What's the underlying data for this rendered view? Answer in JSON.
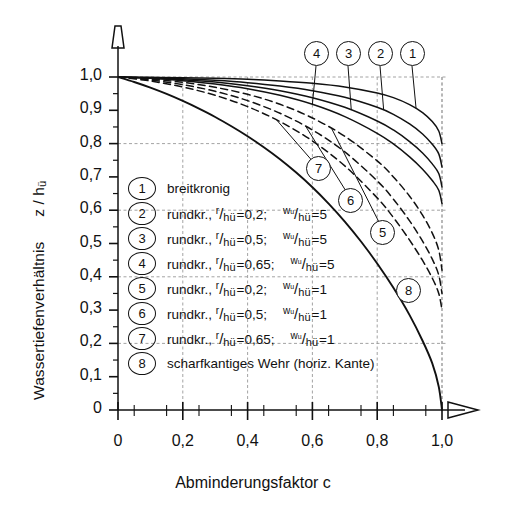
{
  "chart_data": {
    "type": "line",
    "title": "",
    "xlabel": "Abminderungsfaktor c",
    "ylabel": "Wassertiefenverhältnis z / hü",
    "xlim": [
      0,
      1.0
    ],
    "ylim": [
      0,
      1.0
    ],
    "xticks": [
      "0",
      "0,2",
      "0,4",
      "0,6",
      "0,8",
      "1,0"
    ],
    "xtick_values": [
      0,
      0.2,
      0.4,
      0.6,
      0.8,
      1.0
    ],
    "yticks": [
      "1,0",
      "0,9",
      "0,8",
      "0,7",
      "0,6",
      "0,5",
      "0,4",
      "0,3",
      "0,2",
      "0,1",
      "0"
    ],
    "ytick_values": [
      1.0,
      0.9,
      0.8,
      0.7,
      0.6,
      0.5,
      0.4,
      0.3,
      0.2,
      0.1,
      0
    ],
    "grid": true,
    "grid_style": "dashed",
    "legend_position": "inside-lower-left",
    "series": [
      {
        "id": 1,
        "name": "breitkronig",
        "style": "solid",
        "label_position": "top",
        "points": [
          [
            0,
            1.0
          ],
          [
            0.1,
            0.999
          ],
          [
            0.2,
            0.998
          ],
          [
            0.3,
            0.996
          ],
          [
            0.4,
            0.993
          ],
          [
            0.5,
            0.988
          ],
          [
            0.6,
            0.981
          ],
          [
            0.7,
            0.97
          ],
          [
            0.8,
            0.952
          ],
          [
            0.85,
            0.938
          ],
          [
            0.9,
            0.917
          ],
          [
            0.94,
            0.893
          ],
          [
            0.97,
            0.866
          ],
          [
            0.99,
            0.838
          ],
          [
            1.0,
            0.8
          ]
        ]
      },
      {
        "id": 2,
        "name": "rundkr., r/hü =0,2; wu/hü =5",
        "style": "solid",
        "label_position": "top",
        "points": [
          [
            0,
            1.0
          ],
          [
            0.1,
            0.998
          ],
          [
            0.2,
            0.995
          ],
          [
            0.3,
            0.99
          ],
          [
            0.4,
            0.983
          ],
          [
            0.5,
            0.973
          ],
          [
            0.6,
            0.959
          ],
          [
            0.7,
            0.939
          ],
          [
            0.8,
            0.909
          ],
          [
            0.85,
            0.888
          ],
          [
            0.9,
            0.859
          ],
          [
            0.94,
            0.829
          ],
          [
            0.97,
            0.798
          ],
          [
            0.99,
            0.769
          ],
          [
            1.0,
            0.73
          ]
        ]
      },
      {
        "id": 3,
        "name": "rundkr., r/hü =0,5; wu/hü =5",
        "style": "solid",
        "label_position": "top",
        "points": [
          [
            0,
            1.0
          ],
          [
            0.1,
            0.997
          ],
          [
            0.2,
            0.992
          ],
          [
            0.3,
            0.985
          ],
          [
            0.4,
            0.974
          ],
          [
            0.5,
            0.959
          ],
          [
            0.6,
            0.938
          ],
          [
            0.7,
            0.909
          ],
          [
            0.8,
            0.868
          ],
          [
            0.85,
            0.841
          ],
          [
            0.9,
            0.806
          ],
          [
            0.94,
            0.772
          ],
          [
            0.97,
            0.739
          ],
          [
            0.99,
            0.71
          ],
          [
            1.0,
            0.67
          ]
        ]
      },
      {
        "id": 4,
        "name": "rundkr., r/hü =0,65; wu/hü =5",
        "style": "solid",
        "label_position": "top",
        "points": [
          [
            0,
            1.0
          ],
          [
            0.1,
            0.996
          ],
          [
            0.2,
            0.989
          ],
          [
            0.3,
            0.979
          ],
          [
            0.4,
            0.965
          ],
          [
            0.5,
            0.945
          ],
          [
            0.6,
            0.918
          ],
          [
            0.7,
            0.881
          ],
          [
            0.8,
            0.831
          ],
          [
            0.85,
            0.799
          ],
          [
            0.9,
            0.76
          ],
          [
            0.94,
            0.723
          ],
          [
            0.97,
            0.689
          ],
          [
            0.99,
            0.66
          ],
          [
            1.0,
            0.62
          ]
        ]
      },
      {
        "id": 5,
        "name": "rundkr., r/hü =0,2; wu/hü =1",
        "style": "dashed",
        "label_position": "curve",
        "points": [
          [
            0,
            1.0
          ],
          [
            0.1,
            0.994
          ],
          [
            0.2,
            0.984
          ],
          [
            0.3,
            0.969
          ],
          [
            0.4,
            0.948
          ],
          [
            0.5,
            0.918
          ],
          [
            0.6,
            0.877
          ],
          [
            0.7,
            0.822
          ],
          [
            0.8,
            0.748
          ],
          [
            0.85,
            0.7
          ],
          [
            0.9,
            0.642
          ],
          [
            0.94,
            0.585
          ],
          [
            0.97,
            0.531
          ],
          [
            0.99,
            0.48
          ],
          [
            1.0,
            0.42
          ]
        ]
      },
      {
        "id": 6,
        "name": "rundkr., r/hü =0,5; wu/hü =1",
        "style": "dashed",
        "label_position": "curve",
        "points": [
          [
            0,
            1.0
          ],
          [
            0.1,
            0.991
          ],
          [
            0.2,
            0.977
          ],
          [
            0.3,
            0.957
          ],
          [
            0.4,
            0.929
          ],
          [
            0.5,
            0.891
          ],
          [
            0.6,
            0.841
          ],
          [
            0.7,
            0.775
          ],
          [
            0.8,
            0.688
          ],
          [
            0.85,
            0.633
          ],
          [
            0.9,
            0.568
          ],
          [
            0.94,
            0.507
          ],
          [
            0.97,
            0.453
          ],
          [
            0.99,
            0.405
          ],
          [
            1.0,
            0.35
          ]
        ]
      },
      {
        "id": 7,
        "name": "rundkr., r/hü =0,65; wu/hü =1",
        "style": "dashed",
        "label_position": "curve",
        "points": [
          [
            0,
            1.0
          ],
          [
            0.1,
            0.988
          ],
          [
            0.2,
            0.97
          ],
          [
            0.3,
            0.945
          ],
          [
            0.4,
            0.911
          ],
          [
            0.5,
            0.866
          ],
          [
            0.6,
            0.808
          ],
          [
            0.7,
            0.733
          ],
          [
            0.8,
            0.637
          ],
          [
            0.85,
            0.578
          ],
          [
            0.9,
            0.51
          ],
          [
            0.94,
            0.449
          ],
          [
            0.97,
            0.396
          ],
          [
            0.99,
            0.35
          ],
          [
            1.0,
            0.3
          ]
        ]
      },
      {
        "id": 8,
        "name": "scharfkantiges Wehr (horiz. Kante)",
        "style": "solid",
        "label_position": "curve",
        "points": [
          [
            0,
            1.0
          ],
          [
            0.05,
            0.985
          ],
          [
            0.1,
            0.968
          ],
          [
            0.15,
            0.949
          ],
          [
            0.2,
            0.928
          ],
          [
            0.25,
            0.905
          ],
          [
            0.3,
            0.88
          ],
          [
            0.35,
            0.852
          ],
          [
            0.4,
            0.822
          ],
          [
            0.45,
            0.789
          ],
          [
            0.5,
            0.753
          ],
          [
            0.55,
            0.713
          ],
          [
            0.6,
            0.669
          ],
          [
            0.65,
            0.62
          ],
          [
            0.7,
            0.566
          ],
          [
            0.75,
            0.506
          ],
          [
            0.8,
            0.44
          ],
          [
            0.85,
            0.367
          ],
          [
            0.9,
            0.285
          ],
          [
            0.94,
            0.208
          ],
          [
            0.97,
            0.14
          ],
          [
            0.99,
            0.07
          ],
          [
            1.0,
            0
          ]
        ]
      }
    ]
  },
  "axis": {
    "y_title_main": "Wassertiefenverhältnis",
    "y_title_var": "z / h",
    "y_title_sub": "ü",
    "x_title": "Abminderungsfaktor c"
  },
  "legend": {
    "items": [
      {
        "num": "1",
        "text": "breitkronig",
        "has_fractions": false
      },
      {
        "num": "2",
        "prefix": "rundkr.,",
        "f1_num": "r",
        "f1_den": "h",
        "f1_sub": "ü",
        "f1_val": "=0,2;",
        "f2_num": "w",
        "f2_numsub": "u",
        "f2_den": "h",
        "f2_sub": "ü",
        "f2_val": "=5",
        "has_fractions": true
      },
      {
        "num": "3",
        "prefix": "rundkr.,",
        "f1_num": "r",
        "f1_den": "h",
        "f1_sub": "ü",
        "f1_val": "=0,5;",
        "f2_num": "w",
        "f2_numsub": "u",
        "f2_den": "h",
        "f2_sub": "ü",
        "f2_val": "=5",
        "has_fractions": true
      },
      {
        "num": "4",
        "prefix": "rundkr.,",
        "f1_num": "r",
        "f1_den": "h",
        "f1_sub": "ü",
        "f1_val": "=0,65;",
        "f2_num": "w",
        "f2_numsub": "u",
        "f2_den": "h",
        "f2_sub": "ü",
        "f2_val": "=5",
        "has_fractions": true
      },
      {
        "num": "5",
        "prefix": "rundkr.,",
        "f1_num": "r",
        "f1_den": "h",
        "f1_sub": "ü",
        "f1_val": "=0,2;",
        "f2_num": "w",
        "f2_numsub": "u",
        "f2_den": "h",
        "f2_sub": "ü",
        "f2_val": "=1",
        "has_fractions": true
      },
      {
        "num": "6",
        "prefix": "rundkr.,",
        "f1_num": "r",
        "f1_den": "h",
        "f1_sub": "ü",
        "f1_val": "=0,5;",
        "f2_num": "w",
        "f2_numsub": "u",
        "f2_den": "h",
        "f2_sub": "ü",
        "f2_val": "=1",
        "has_fractions": true
      },
      {
        "num": "7",
        "prefix": "rundkr.,",
        "f1_num": "r",
        "f1_den": "h",
        "f1_sub": "ü",
        "f1_val": "=0,65;",
        "f2_num": "w",
        "f2_numsub": "u",
        "f2_den": "h",
        "f2_sub": "ü",
        "f2_val": "=1",
        "has_fractions": true
      },
      {
        "num": "8",
        "text": "scharfkantiges Wehr (horiz. Kante)",
        "has_fractions": false
      }
    ]
  },
  "curve_labels": {
    "top": [
      "4",
      "3",
      "2",
      "1"
    ],
    "inner": [
      "7",
      "6",
      "5",
      "8"
    ]
  },
  "colors": {
    "ink": "#111111",
    "grid": "#999999",
    "background": "#ffffff"
  }
}
